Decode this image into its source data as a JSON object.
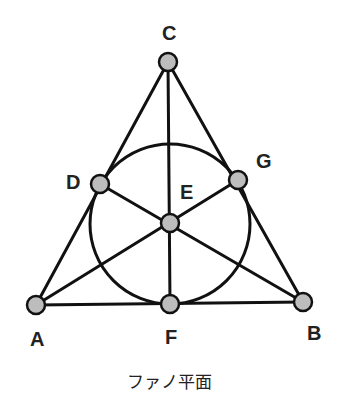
{
  "caption": "ファノ平面",
  "colors": {
    "line": "#111111",
    "node_fill": "#bdbdbd",
    "node_stroke": "#111111",
    "label": "#222222",
    "background": "#ffffff"
  },
  "points": {
    "A": {
      "label": "A",
      "x": 36,
      "y": 305
    },
    "B": {
      "label": "B",
      "x": 303,
      "y": 302
    },
    "C": {
      "label": "C",
      "x": 168,
      "y": 62
    },
    "D": {
      "label": "D",
      "x": 100,
      "y": 184
    },
    "E": {
      "label": "E",
      "x": 170,
      "y": 223
    },
    "F": {
      "label": "F",
      "x": 170,
      "y": 304
    },
    "G": {
      "label": "G",
      "x": 238,
      "y": 180
    }
  },
  "lines": [
    [
      "A",
      "D",
      "C"
    ],
    [
      "C",
      "G",
      "B"
    ],
    [
      "A",
      "F",
      "B"
    ],
    [
      "C",
      "E",
      "F"
    ],
    [
      "A",
      "E",
      "G"
    ],
    [
      "B",
      "E",
      "D"
    ],
    [
      "D",
      "G",
      "F"
    ]
  ],
  "circle": {
    "cx": 170,
    "cy": 224,
    "r": 80,
    "through": [
      "D",
      "G",
      "F"
    ]
  }
}
